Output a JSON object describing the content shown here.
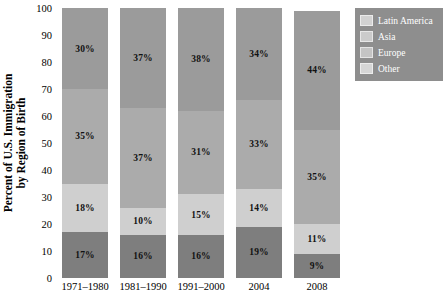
{
  "chart_data": {
    "type": "bar",
    "stacked": true,
    "title": "",
    "xlabel": "",
    "ylabel": "Percent of U.S. Immigration by Region of Birth",
    "ylabel_line1": "Percent of U.S. Immigration",
    "ylabel_line2": "by Region of Birth",
    "ylim": [
      0,
      100
    ],
    "yticks": [
      0,
      10,
      20,
      30,
      40,
      50,
      60,
      70,
      80,
      90,
      100
    ],
    "grid": false,
    "legend_position": "top-right",
    "categories": [
      "1971–1980",
      "1981–1990",
      "1991–2000",
      "2004",
      "2008"
    ],
    "series": [
      {
        "name": "Latin America",
        "color": "#7e7e7e",
        "values": [
          17,
          16,
          16,
          19,
          9
        ],
        "labels": [
          "17%",
          "16%",
          "16%",
          "19%",
          "9%"
        ]
      },
      {
        "name": "Asia",
        "color": "#cfcfcf",
        "values": [
          18,
          10,
          15,
          14,
          11
        ],
        "labels": [
          "18%",
          "10%",
          "15%",
          "14%",
          "11%"
        ]
      },
      {
        "name": "Europe",
        "color": "#ababab",
        "values": [
          35,
          37,
          31,
          33,
          35
        ],
        "labels": [
          "35%",
          "37%",
          "31%",
          "33%",
          "35%"
        ]
      },
      {
        "name": "Other",
        "color": "#9b9b9b",
        "values": [
          30,
          37,
          38,
          34,
          44
        ],
        "labels": [
          "30%",
          "37%",
          "38%",
          "34%",
          "44%"
        ]
      }
    ]
  },
  "legend": {
    "background_color": "#8e8e8e",
    "items": [
      {
        "label": "Latin America",
        "color": "#d2d2d2"
      },
      {
        "label": "Asia",
        "color": "#cbcbcb"
      },
      {
        "label": "Europe",
        "color": "#c4c4c4"
      },
      {
        "label": "Other",
        "color": "#d6d6d6"
      }
    ]
  }
}
